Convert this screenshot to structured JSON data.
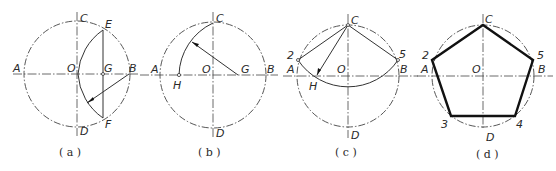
{
  "figures": [
    {
      "id": "a",
      "caption": "( a )",
      "labels": {
        "A": "A",
        "B": "B",
        "C": "C",
        "D": "D",
        "O": "O",
        "E": "E",
        "F": "F",
        "G": "G"
      },
      "description": "Circle with diameters AB and CD; perpendicular bisector EF of OB through G; arc from E to F centered at B"
    },
    {
      "id": "b",
      "caption": "( b )",
      "labels": {
        "A": "A",
        "B": "B",
        "C": "C",
        "D": "D",
        "O": "O",
        "G": "G",
        "H": "H"
      },
      "description": "Arc centered at G with radius GC intersecting OA at H"
    },
    {
      "id": "c",
      "caption": "( c )",
      "labels": {
        "A": "A",
        "B": "B",
        "C": "C",
        "D": "D",
        "O": "O",
        "H": "H",
        "p2": "2",
        "p5": "5"
      },
      "description": "Arc centered at C with radius CH intersecting circle at points 2 and 5; chords C-2 and C-5"
    },
    {
      "id": "d",
      "caption": "( d )",
      "labels": {
        "A": "A",
        "B": "B",
        "C": "C",
        "D": "D",
        "O": "O",
        "p2": "2",
        "p3": "3",
        "p4": "4",
        "p5": "5"
      },
      "description": "Regular pentagon C-5-4-3-2 inscribed in circle"
    }
  ]
}
